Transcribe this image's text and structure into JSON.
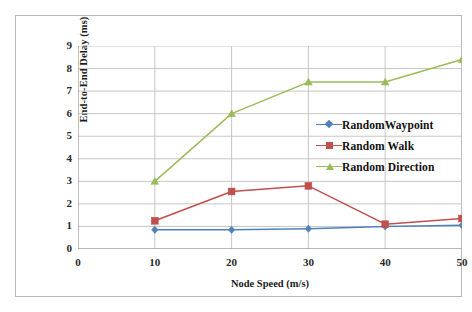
{
  "chart_data": {
    "type": "line",
    "title": "",
    "xlabel": "Node Speed (m/s)",
    "ylabel": "End-to-End Delay (ms)",
    "x": [
      10,
      20,
      30,
      40,
      50
    ],
    "xlim": [
      0,
      50
    ],
    "ylim": [
      0,
      9
    ],
    "xticks": [
      0,
      10,
      20,
      30,
      40,
      50
    ],
    "yticks": [
      0,
      1,
      2,
      3,
      4,
      5,
      6,
      7,
      8,
      9
    ],
    "grid": "horizontal-and-vertical",
    "legend_position": "center-right-inside",
    "series": [
      {
        "name": "RandomWaypoint",
        "color": "#4f81bd",
        "marker": "diamond",
        "values": [
          0.85,
          0.85,
          0.9,
          1.0,
          1.05
        ]
      },
      {
        "name": "Random Walk",
        "color": "#c0504d",
        "marker": "square",
        "values": [
          1.25,
          2.55,
          2.8,
          1.1,
          1.35
        ]
      },
      {
        "name": "Random Direction",
        "color": "#9bbb59",
        "marker": "triangle",
        "values": [
          3.0,
          6.0,
          7.4,
          7.4,
          8.4
        ]
      }
    ]
  },
  "axes": {
    "y_tick_labels": [
      "9",
      "8",
      "7",
      "6",
      "5",
      "4",
      "3",
      "2",
      "1",
      "0"
    ],
    "x_tick_labels": [
      "0",
      "10",
      "20",
      "30",
      "40",
      "50"
    ],
    "x_title": "Node Speed (m/s)",
    "y_title": "End-to-End Delay (ms)"
  },
  "legend": {
    "items": [
      {
        "label": "RandomWaypoint",
        "color": "#4f81bd"
      },
      {
        "label": "Random Walk",
        "color": "#c0504d"
      },
      {
        "label": "Random Direction",
        "color": "#9bbb59"
      }
    ]
  },
  "colors": {
    "grid": "#bfbfbf",
    "axis": "#8c8c8c",
    "frame": "#b8b8b8",
    "text": "#1b1b1b",
    "background": "#ffffff"
  }
}
